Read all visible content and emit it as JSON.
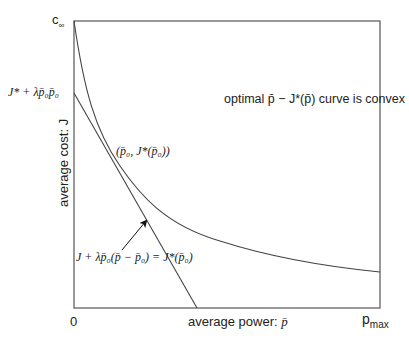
{
  "diagram": {
    "axes": {
      "x_label": "average power: p̄",
      "x_label_text": "average power: ",
      "x_label_symbol": "p̄",
      "y_label": "average cost: J",
      "x_origin_tick": "0",
      "x_max_tick_base": "p",
      "x_max_tick_sub": "max",
      "y_top_tick_base": "c",
      "y_top_tick_sub": "∞",
      "y_intercept_label": "J* + λp̄₀p̄₀"
    },
    "annotations": {
      "convexity_note": "optimal p̄ − J*(p̄) curve is convex",
      "tangent_point": "(p̄₀, J*(p̄₀))",
      "tangent_equation": "J + λp̄₀(p̄ − p̄₀) = J*(p̄₀)"
    },
    "colors": {
      "frame": "#555555",
      "curve": "#444444",
      "text": "#222222",
      "background": "#ffffff"
    }
  }
}
